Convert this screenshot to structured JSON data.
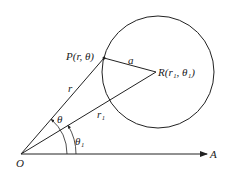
{
  "diagram": {
    "type": "polar-coordinates-circle",
    "labels": {
      "origin": "O",
      "axis_end": "A",
      "point_p": "P(r, θ)",
      "point_r": "R(r₁, θ₁)",
      "segment_op": "r",
      "segment_or": "r₁",
      "segment_pr": "a",
      "angle_p": "θ",
      "angle_r": "θ₁"
    },
    "colors": {
      "stroke": "#222222",
      "background": "#ffffff"
    }
  }
}
